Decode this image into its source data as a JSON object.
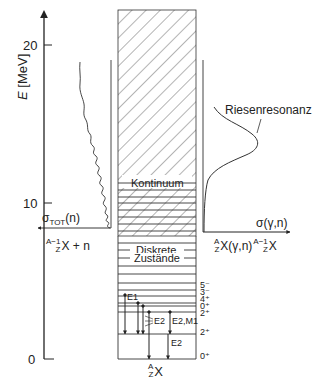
{
  "axis": {
    "label_italic": "E",
    "label_unit": "[MeV]",
    "ticks": [
      {
        "value": "20",
        "y": 45
      },
      {
        "value": "10",
        "y": 203
      },
      {
        "value": "0",
        "y": 359
      }
    ]
  },
  "continuum": {
    "label": "Kontinuum"
  },
  "discrete": {
    "label_line1": "Diskrete",
    "label_line2": "Zustände"
  },
  "spins": [
    "5⁻",
    "3⁻",
    "4⁺",
    "0⁺",
    "2⁺",
    "2⁺",
    "0⁺"
  ],
  "transitions": {
    "e1": "E1",
    "e2_a": "E2",
    "e2_m1": "E2,M1",
    "e2_b": "E2"
  },
  "nucleus": {
    "A": "A",
    "Z": "Z",
    "symbol": "X"
  },
  "left_channel": {
    "sigma_label": "σ",
    "sigma_sub": "TOT",
    "sigma_arg": "(n)",
    "reaction_sup": "A−1",
    "reaction_sub": "Z",
    "reaction_text": "X + n"
  },
  "right_channel": {
    "sigma_label": "σ(γ,n)",
    "resonance_label": "Riesenresonanz",
    "reaction_sup1": "A",
    "reaction_sub1": "Z",
    "reaction_mid": "X(γ,n)",
    "reaction_sup2": "A−1",
    "reaction_sub2": "Z",
    "reaction_end": "X"
  }
}
